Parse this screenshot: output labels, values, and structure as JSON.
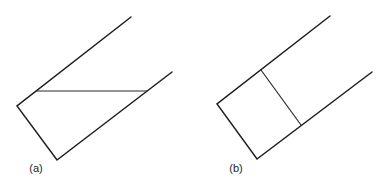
{
  "colors": {
    "background": "#ffffff",
    "stroke": "#1e1e1e"
  },
  "figures": [
    {
      "id": "a",
      "label": "(a)",
      "label_pos": [
        36,
        172
      ],
      "outline": [
        [
          131,
          17
        ],
        [
          17,
          106
        ],
        [
          57,
          160
        ],
        [
          172,
          72
        ]
      ],
      "cross_line": [
        [
          37,
          91
        ],
        [
          147,
          91
        ]
      ],
      "cross_type": "horizontal"
    },
    {
      "id": "b",
      "label": "(b)",
      "label_pos": [
        236,
        172
      ],
      "outline": [
        [
          330,
          16
        ],
        [
          217,
          104
        ],
        [
          257,
          159
        ],
        [
          372,
          72
        ]
      ],
      "cross_line": [
        [
          261,
          70
        ],
        [
          301,
          125
        ]
      ],
      "cross_type": "perpendicular"
    }
  ]
}
